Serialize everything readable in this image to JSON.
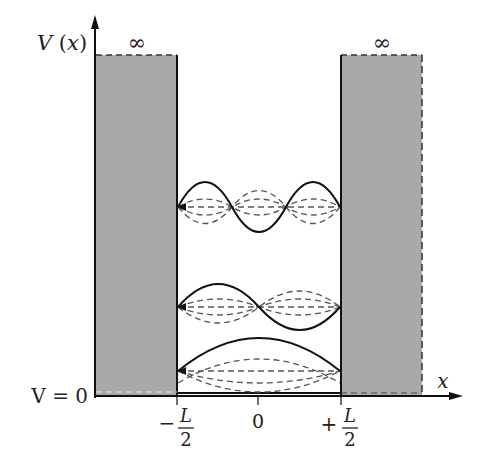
{
  "diagram": {
    "axes": {
      "y_label": "V(x)",
      "y_label_parts": {
        "name": "V",
        "arg": "x"
      },
      "x_label": "x",
      "baseline_label": "V = 0"
    },
    "walls": {
      "left_label": "∞",
      "right_label": "∞",
      "fill_color": "#a9a9a9"
    },
    "ticks": [
      {
        "id": "minus-half-L",
        "sign": "−",
        "numerator": "L",
        "denominator": "2",
        "x": 177
      },
      {
        "id": "zero",
        "text": "0",
        "x": 259
      },
      {
        "id": "plus-half-L",
        "sign": "+",
        "numerator": "L",
        "denominator": "2",
        "x": 341
      }
    ],
    "levels": [
      {
        "n": 1,
        "y": 371,
        "amplitude": 22,
        "style": "solid curve with dashed time snapshots"
      },
      {
        "n": 2,
        "y": 307,
        "amplitude": 23,
        "style": "solid curve with dashed time snapshots"
      },
      {
        "n": 3,
        "y": 207,
        "amplitude": 25,
        "style": "solid curve with dashed time snapshots"
      }
    ],
    "colors": {
      "line": "#111111",
      "dashed": "#555555",
      "wall": "#a9a9a9"
    }
  }
}
